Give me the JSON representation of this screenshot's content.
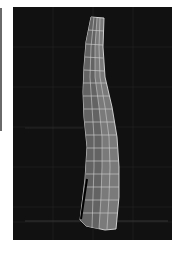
{
  "app": {
    "panel": "viewport"
  },
  "viewport": {
    "background": "#111111",
    "grid_color": "#2a2a2a",
    "mesh": {
      "type": "wireframe-tube",
      "fill": "#7d7d7d",
      "shade": "#5a5a5a",
      "edge_color": "#d8d8d8",
      "selected_edge_color": "#000000"
    }
  }
}
